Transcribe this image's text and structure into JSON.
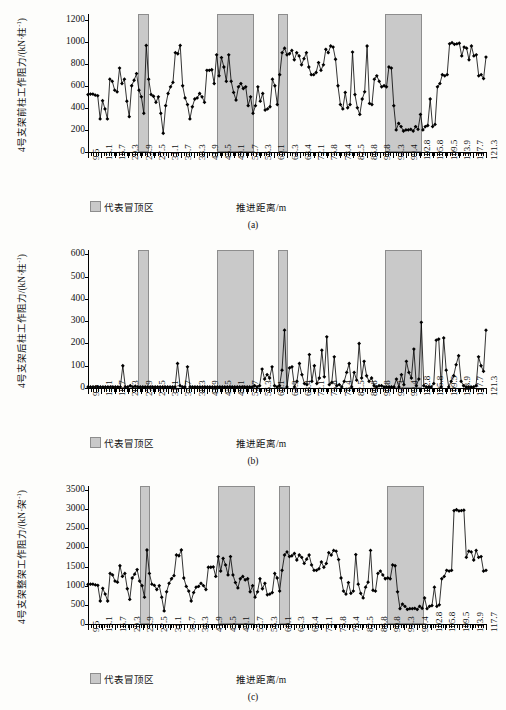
{
  "figure": {
    "legend_label": "代表冒顶区",
    "x_axis_title": "推进距离/m",
    "axis_unit_column": "kN·柱",
    "axis_unit_frame": "kN·架",
    "exponent": "-1"
  },
  "panels": [
    {
      "caption": "(a)",
      "y_title_prefix": "4号支架前柱工作阻力/(",
      "y_title_unit": "kN·柱",
      "y_title_sup": "-1",
      "y_title_suffix": ")",
      "legend_label": "代表冒顶区",
      "x_axis_title": "推进距离/m"
    },
    {
      "caption": "(b)",
      "y_title_prefix": "4号支架后柱工作阻力/(",
      "y_title_unit": "kN·柱",
      "y_title_sup": "-1",
      "y_title_suffix": ")",
      "legend_label": "代表冒顶区",
      "x_axis_title": "推进距离/m"
    },
    {
      "caption": "(c)",
      "y_title_prefix": "4号支架整架工作阻力/(",
      "y_title_unit": "kN·架",
      "y_title_sup": "-1",
      "y_title_suffix": ")",
      "legend_label": "代表冒顶区",
      "x_axis_title": "推进距离/m"
    }
  ],
  "chart_data": [
    {
      "type": "line",
      "title": "",
      "panel": "(a)",
      "ylabel": "4号支架前柱工作阻力/(kN·柱-1)",
      "xlabel": "推进距离/m",
      "ylim": [
        0,
        1250
      ],
      "yticks": [
        0,
        200,
        400,
        600,
        800,
        1000,
        1200
      ],
      "grid": false,
      "legend": [
        {
          "label": "代表冒顶区",
          "color": "#c9c9c9"
        }
      ],
      "xtick_labels": [
        "9.5",
        "13.1",
        "16.7",
        "20.3",
        "23.9",
        "27.5",
        "31.1",
        "34.7",
        "38.3",
        "41.9",
        "45.5",
        "49.1",
        "52.7",
        "56.3",
        "60.1",
        "64.3",
        "68.4",
        "72.1",
        "75.8",
        "78.4",
        "82.5",
        "86.8",
        "90.8",
        "94.3",
        "99.4",
        "102.8",
        "105.8",
        "109.5",
        "113.9",
        "117.7",
        "121.3"
      ],
      "xlim": [
        0,
        150
      ],
      "shaded_regions": [
        {
          "x0": 19.0,
          "x1": 23.0,
          "label": "代表冒顶区"
        },
        {
          "x0": 48.5,
          "x1": 62.5,
          "label": "代表冒顶区"
        },
        {
          "x0": 71.5,
          "x1": 75.5,
          "label": "代表冒顶区"
        },
        {
          "x0": 112.0,
          "x1": 126.0,
          "label": "代表冒顶区"
        }
      ],
      "values": [
        520,
        525,
        525,
        515,
        510,
        300,
        465,
        390,
        300,
        660,
        640,
        560,
        545,
        760,
        620,
        660,
        460,
        320,
        600,
        650,
        710,
        560,
        500,
        350,
        965,
        660,
        520,
        505,
        450,
        500,
        350,
        170,
        420,
        530,
        590,
        630,
        900,
        890,
        965,
        600,
        490,
        430,
        300,
        410,
        480,
        490,
        530,
        500,
        450,
        740,
        740,
        745,
        620,
        880,
        690,
        855,
        770,
        640,
        880,
        640,
        540,
        470,
        590,
        620,
        575,
        590,
        420,
        500,
        350,
        420,
        590,
        460,
        530,
        380,
        390,
        410,
        660,
        600,
        430,
        700,
        900,
        940,
        880,
        890,
        920,
        835,
        900,
        870,
        790,
        845,
        900,
        770,
        700,
        700,
        720,
        810,
        740,
        790,
        930,
        900,
        960,
        950,
        840,
        600,
        430,
        390,
        540,
        400,
        430,
        905,
        520,
        400,
        340,
        480,
        545,
        960,
        440,
        430,
        660,
        690,
        640,
        590,
        600,
        590,
        770,
        760,
        420,
        200,
        260,
        230,
        190,
        200,
        200,
        205,
        190,
        230,
        205,
        340,
        200,
        230,
        240,
        480,
        230,
        250,
        590,
        620,
        700,
        690,
        700,
        980,
        990,
        975,
        980,
        985,
        870,
        950,
        940,
        835,
        960,
        870,
        880,
        690,
        700,
        665,
        860
      ],
      "marker": "diamond"
    },
    {
      "type": "line",
      "title": "",
      "panel": "(b)",
      "ylabel": "4号支架后柱工作阻力/(kN·柱-1)",
      "xlabel": "推进距离/m",
      "ylim": [
        0,
        620
      ],
      "yticks": [
        0,
        100,
        200,
        300,
        400,
        500,
        600
      ],
      "grid": false,
      "legend": [
        {
          "label": "代表冒顶区",
          "color": "#c9c9c9"
        }
      ],
      "xtick_labels": [
        "9.5",
        "13.1",
        "16.7",
        "20.3",
        "23.9",
        "27.5",
        "31.1",
        "34.7",
        "38.3",
        "41.9",
        "45.5",
        "49.1",
        "52.7",
        "56.3",
        "60.1",
        "64.3",
        "68.4",
        "72.1",
        "75.8",
        "78.4",
        "82.5",
        "86.8",
        "90.8",
        "94.3",
        "99.4",
        "102.8",
        "105.8",
        "109.5",
        "113.9",
        "117.7",
        "121.3"
      ],
      "xlim": [
        0,
        150
      ],
      "shaded_regions": [
        {
          "x0": 19.0,
          "x1": 23.0,
          "label": "代表冒顶区"
        },
        {
          "x0": 48.5,
          "x1": 62.5,
          "label": "代表冒顶区"
        },
        {
          "x0": 71.5,
          "x1": 75.5,
          "label": "代表冒顶区"
        },
        {
          "x0": 112.0,
          "x1": 126.0,
          "label": "代表冒顶区"
        }
      ],
      "values": [
        5,
        5,
        5,
        5,
        5,
        5,
        5,
        5,
        5,
        5,
        5,
        5,
        5,
        5,
        100,
        5,
        5,
        10,
        5,
        8,
        5,
        5,
        5,
        5,
        5,
        5,
        5,
        5,
        5,
        5,
        5,
        5,
        5,
        5,
        5,
        5,
        110,
        10,
        5,
        5,
        95,
        5,
        5,
        5,
        5,
        5,
        5,
        5,
        5,
        5,
        5,
        5,
        5,
        5,
        5,
        5,
        5,
        5,
        5,
        5,
        5,
        5,
        5,
        5,
        5,
        5,
        5,
        10,
        5,
        10,
        85,
        40,
        60,
        45,
        95,
        10,
        5,
        10,
        80,
        260,
        5,
        90,
        95,
        5,
        30,
        110,
        60,
        20,
        15,
        150,
        30,
        100,
        20,
        45,
        170,
        50,
        230,
        15,
        25,
        140,
        10,
        15,
        5,
        30,
        70,
        110,
        5,
        70,
        35,
        200,
        45,
        120,
        55,
        30,
        45,
        10,
        5,
        10,
        10,
        5,
        5,
        5,
        5,
        5,
        40,
        5,
        60,
        15,
        120,
        70,
        45,
        175,
        10,
        40,
        295,
        10,
        5,
        5,
        5,
        20,
        215,
        220,
        5,
        225,
        80,
        5,
        30,
        55,
        105,
        145,
        30,
        10,
        5,
        5,
        5,
        5,
        10,
        140,
        100,
        75,
        260
      ],
      "marker": "diamond"
    },
    {
      "type": "line",
      "title": "",
      "panel": "(c)",
      "ylabel": "4号支架整架工作阻力/(kN·架-1)",
      "xlabel": "推进距离/m",
      "ylim": [
        0,
        3600
      ],
      "yticks": [
        0,
        500,
        1000,
        1500,
        2000,
        2500,
        3000,
        3500
      ],
      "grid": false,
      "legend": [
        {
          "label": "代表冒顶区",
          "color": "#c9c9c9"
        }
      ],
      "xtick_labels": [
        "9.5",
        "13.1",
        "16.7",
        "20.3",
        "23.9",
        "27.5",
        "31.1",
        "34.7",
        "38.3",
        "41.9",
        "45.5",
        "49.1",
        "52.7",
        "56.3",
        "60.1",
        "64.3",
        "68.4",
        "72.1",
        "75.8",
        "78.4",
        "82.5",
        "86.8",
        "90.8",
        "94.3",
        "99.4",
        "102.8",
        "105.8",
        "109.5",
        "113.9",
        "117.7"
      ],
      "xlim": [
        0,
        150
      ],
      "shaded_regions": [
        {
          "x0": 19.5,
          "x1": 23.5,
          "label": "代表冒顶区"
        },
        {
          "x0": 49.0,
          "x1": 63.0,
          "label": "代表冒顶区"
        },
        {
          "x0": 72.0,
          "x1": 76.0,
          "label": "代表冒顶区"
        },
        {
          "x0": 112.5,
          "x1": 126.5,
          "label": "代表冒顶区"
        }
      ],
      "values": [
        1030,
        1040,
        1040,
        1020,
        1010,
        600,
        930,
        780,
        600,
        1320,
        1280,
        1120,
        1090,
        1520,
        1240,
        1320,
        920,
        640,
        1200,
        1300,
        1420,
        1120,
        1000,
        700,
        1930,
        1320,
        1040,
        1010,
        900,
        1000,
        700,
        340,
        840,
        1060,
        1180,
        1260,
        1800,
        1780,
        1930,
        1200,
        980,
        860,
        600,
        820,
        960,
        980,
        1060,
        1000,
        900,
        1480,
        1480,
        1490,
        1240,
        1760,
        1380,
        1710,
        1540,
        1280,
        1760,
        1280,
        1080,
        940,
        1180,
        1240,
        1150,
        1180,
        840,
        1000,
        700,
        840,
        1180,
        920,
        1060,
        760,
        780,
        820,
        1320,
        1200,
        860,
        1400,
        1800,
        1880,
        1760,
        1780,
        1840,
        1670,
        1800,
        1740,
        1580,
        1690,
        1800,
        1540,
        1400,
        1400,
        1440,
        1620,
        1480,
        1580,
        1860,
        1800,
        1920,
        1900,
        1680,
        1200,
        860,
        780,
        1080,
        800,
        860,
        1810,
        1040,
        800,
        680,
        960,
        1090,
        1920,
        880,
        860,
        1320,
        1380,
        1280,
        1180,
        1200,
        1180,
        1540,
        1520,
        840,
        400,
        520,
        460,
        380,
        400,
        400,
        410,
        380,
        460,
        410,
        680,
        400,
        460,
        480,
        960,
        460,
        500,
        1180,
        1240,
        1400,
        1380,
        1400,
        2960,
        2980,
        2950,
        2960,
        2970,
        1740,
        1900,
        1880,
        1670,
        1920,
        1740,
        1760,
        1380,
        1400
      ],
      "marker": "diamond"
    }
  ]
}
